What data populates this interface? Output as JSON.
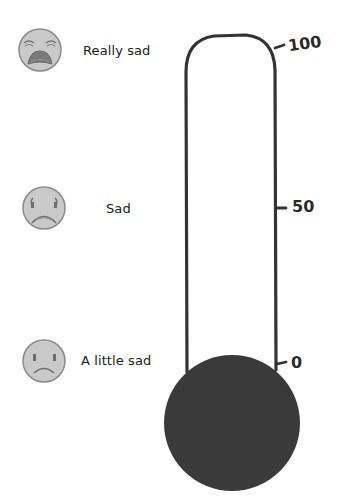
{
  "diagram": {
    "type": "feelings-thermometer",
    "levels": [
      {
        "label": "Really sad",
        "face": "crying-face-icon"
      },
      {
        "label": "Sad",
        "face": "sad-face-icon"
      },
      {
        "label": "A little sad",
        "face": "slightly-sad-face-icon"
      }
    ],
    "scale": {
      "ticks": [
        {
          "value": "100"
        },
        {
          "value": "50"
        },
        {
          "value": "0"
        }
      ]
    },
    "colors": {
      "outline": "#333333",
      "bulb": "#3a3a3a",
      "face_fill": "#c9c9c9",
      "face_stroke": "#8a8a8a",
      "face_feature": "#6e6e6e"
    }
  }
}
